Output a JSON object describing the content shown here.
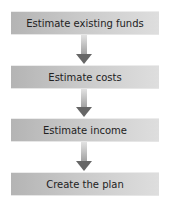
{
  "diagram": {
    "type": "flowchart",
    "direction": "top-to-bottom",
    "steps": [
      {
        "label": "Estimate existing funds"
      },
      {
        "label": "Estimate costs"
      },
      {
        "label": "Estimate income"
      },
      {
        "label": "Create the plan"
      }
    ],
    "connectors": [
      {
        "from": 0,
        "to": 1,
        "icon": "down-arrow-icon"
      },
      {
        "from": 1,
        "to": 2,
        "icon": "down-arrow-icon"
      },
      {
        "from": 2,
        "to": 3,
        "icon": "down-arrow-icon"
      }
    ],
    "colors": {
      "box_gradient_left": "#b4b4b4",
      "box_gradient_right": "#dedede",
      "arrow_head": "#666666",
      "text": "#222222"
    }
  }
}
